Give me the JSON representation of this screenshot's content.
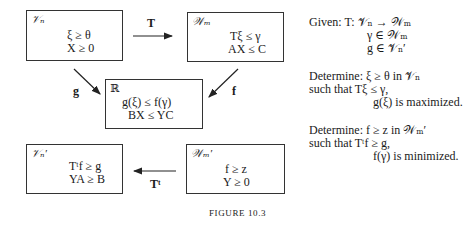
{
  "boxes": {
    "top_left": {
      "space": "𝒱ₙ",
      "lines": [
        "ξ ≥ θ",
        "X ≥ 0"
      ]
    },
    "top_right": {
      "space": "𝒲ₘ",
      "lines": [
        "Tξ ≤ γ",
        "AX ≤ C"
      ]
    },
    "center": {
      "space": "ℝ",
      "lines": [
        "g(ξ) ≤ f(γ)",
        "BX ≤ YC"
      ]
    },
    "bottom_left": {
      "space": "𝒱ₙ′",
      "lines": [
        "Tᵗf ≥ g",
        "YA ≥ B"
      ]
    },
    "bottom_right": {
      "space": "𝒲ₘ′",
      "lines": [
        "f ≥ z",
        "Y ≥ 0"
      ]
    }
  },
  "arrows": {
    "top": "T",
    "left_diag": "g",
    "right_diag": "f",
    "bottom": "Tᵗ"
  },
  "side_text": {
    "given": [
      "Given: T: 𝒱ₙ → 𝒲ₘ",
      "γ ∈ 𝒲ₘ",
      "g ∈ 𝒱ₙ′"
    ],
    "determine1": [
      "Determine: ξ ≥ θ in 𝒱ₙ",
      "such that Tξ ≤ γ,",
      "g(ξ) is maximized."
    ],
    "determine2": [
      "Determine: f ≥ z in 𝒲ₘ′",
      "such that Tᵗf ≥ g,",
      "f(γ) is minimized."
    ]
  },
  "caption": "FIGURE 10.3"
}
